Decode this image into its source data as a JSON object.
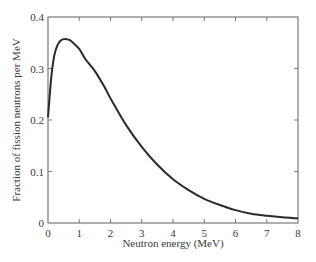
{
  "chart_data": {
    "type": "line",
    "title": "",
    "xlabel": "Neutron energy (MeV)",
    "ylabel": "Fraction of fission neutrons per MeV",
    "xlim": [
      0,
      8
    ],
    "ylim": [
      0,
      0.4
    ],
    "xticks": [
      0,
      1,
      2,
      3,
      4,
      5,
      6,
      7,
      8
    ],
    "yticks": [
      0,
      0.1,
      0.2,
      0.3,
      0.4
    ],
    "xtick_labels": [
      "0",
      "1",
      "2",
      "3",
      "4",
      "5",
      "6",
      "7",
      "8"
    ],
    "ytick_labels": [
      "0",
      "0.1",
      "0.2",
      "0.3",
      "0.4"
    ],
    "grid": false,
    "legend": null,
    "series": [
      {
        "name": "Fission neutron energy spectrum",
        "color": "#2a2a2a",
        "x": [
          0,
          0.1,
          0.2,
          0.3,
          0.4,
          0.5,
          0.6,
          0.7,
          0.8,
          1.0,
          1.2,
          1.5,
          1.8,
          2.0,
          2.5,
          3.0,
          3.5,
          4.0,
          4.5,
          5.0,
          5.5,
          6.0,
          6.5,
          7.0,
          7.5,
          8.0
        ],
        "y": [
          0.205,
          0.28,
          0.325,
          0.345,
          0.354,
          0.357,
          0.357,
          0.355,
          0.35,
          0.338,
          0.318,
          0.295,
          0.265,
          0.242,
          0.19,
          0.148,
          0.113,
          0.085,
          0.064,
          0.047,
          0.035,
          0.025,
          0.018,
          0.014,
          0.011,
          0.009
        ]
      }
    ]
  }
}
